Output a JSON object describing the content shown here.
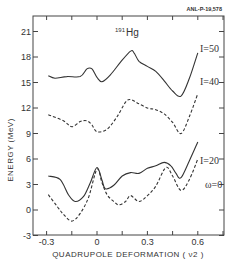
{
  "figure": {
    "reference_id": "ANL-P-19,578",
    "nuclide_mass": "191",
    "nuclide_symbol": "Hg"
  },
  "chart_data": {
    "type": "line",
    "title": "191Hg",
    "xlabel": "QUADRUPOLE DEFORMATION ( ν2 )",
    "ylabel": "ENERGY (MeV)",
    "xlim": [
      -0.35,
      0.75
    ],
    "ylim": [
      -3,
      23
    ],
    "xticks": [
      -0.3,
      0,
      0.3,
      0.6
    ],
    "xtick_labels": [
      "-0.3",
      "0",
      "0.3",
      "0.6"
    ],
    "yticks": [
      -3,
      0,
      3,
      6,
      9,
      12,
      15,
      18,
      21
    ],
    "ytick_labels": [
      "-3",
      "0",
      "3",
      "6",
      "9",
      "12",
      "15",
      "18",
      "21"
    ],
    "grid": false,
    "legend": "inline labels at right end of curves",
    "series": [
      {
        "name": "I=50",
        "style": "solid",
        "x": [
          -0.29,
          -0.25,
          -0.18,
          -0.1,
          -0.06,
          -0.03,
          0.0,
          0.03,
          0.08,
          0.14,
          0.2,
          0.22,
          0.25,
          0.3,
          0.35,
          0.4,
          0.45,
          0.5,
          0.55,
          0.6
        ],
        "y": [
          15.8,
          15.5,
          15.7,
          15.7,
          16.6,
          16.6,
          15.6,
          15.1,
          15.9,
          17.4,
          18.7,
          18.5,
          17.5,
          16.9,
          16.3,
          15.2,
          14.0,
          13.4,
          15.5,
          18.5
        ]
      },
      {
        "name": "I=40",
        "style": "dashed",
        "x": [
          -0.29,
          -0.2,
          -0.15,
          -0.1,
          -0.06,
          -0.03,
          0.0,
          0.06,
          0.12,
          0.17,
          0.2,
          0.24,
          0.3,
          0.35,
          0.4,
          0.45,
          0.5,
          0.55,
          0.6
        ],
        "y": [
          11.2,
          10.5,
          9.8,
          10.4,
          10.5,
          10.0,
          9.2,
          9.5,
          11.0,
          12.7,
          13.0,
          12.6,
          12.0,
          11.8,
          11.3,
          10.3,
          9.0,
          11.0,
          13.7
        ]
      },
      {
        "name": "I=20",
        "style": "solid",
        "x": [
          -0.29,
          -0.22,
          -0.17,
          -0.13,
          -0.08,
          -0.04,
          0.0,
          0.03,
          0.05,
          0.1,
          0.15,
          0.2,
          0.25,
          0.3,
          0.35,
          0.4,
          0.44,
          0.47,
          0.5,
          0.55,
          0.6
        ],
        "y": [
          4.0,
          3.6,
          1.8,
          1.0,
          1.6,
          3.2,
          5.0,
          3.5,
          2.5,
          2.9,
          4.0,
          4.4,
          4.3,
          4.9,
          5.2,
          5.6,
          5.2,
          4.3,
          3.8,
          5.8,
          8.0
        ]
      },
      {
        "name": "ω=0",
        "style": "dashed",
        "x": [
          -0.29,
          -0.24,
          -0.2,
          -0.15,
          -0.1,
          -0.05,
          0.0,
          0.03,
          0.06,
          0.1,
          0.13,
          0.17,
          0.2,
          0.25,
          0.3,
          0.35,
          0.41,
          0.45,
          0.5,
          0.55,
          0.6
        ],
        "y": [
          1.8,
          0.5,
          -0.5,
          -1.3,
          -0.4,
          1.5,
          4.8,
          3.2,
          1.8,
          1.0,
          0.6,
          1.0,
          1.7,
          1.0,
          1.7,
          2.8,
          5.0,
          4.0,
          2.3,
          3.6,
          6.0
        ]
      }
    ],
    "annotations": [
      "191Hg",
      "I=50",
      "I=40",
      "I=20",
      "ω=0",
      "ANL-P-19,578"
    ]
  }
}
